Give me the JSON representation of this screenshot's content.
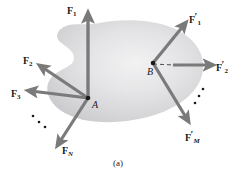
{
  "figure": {
    "caption": "(a)",
    "caption_y": 158,
    "background_color": "#ffffff",
    "arrow_color": "#7a7a7a",
    "dash_color": "#4d4d4d",
    "label_color": "#1a1a1a",
    "blob": {
      "fill_light": "#ececed",
      "fill_mid": "#d8d8da",
      "fill_edge": "#c4c4c7",
      "description": "irregular amoeba-shaped rigid body with concave notch on the left side"
    },
    "points": [
      {
        "name": "A",
        "label": "A",
        "x": 88,
        "y": 98,
        "label_x": 92,
        "label_y": 100
      },
      {
        "name": "B",
        "label": "B",
        "x": 153,
        "y": 63,
        "label_x": 147,
        "label_y": 67
      }
    ],
    "force_vectors": [
      {
        "id": "F1",
        "base": "F",
        "subscript": "1",
        "subscript_italic": false,
        "prime": false,
        "origin": "A",
        "x1": 88,
        "y1": 98,
        "x2": 88,
        "y2": 14,
        "label_x": 67,
        "label_y": 6,
        "width": 3.4
      },
      {
        "id": "F2",
        "base": "F",
        "subscript": "2",
        "subscript_italic": false,
        "prime": false,
        "origin": "A",
        "x1": 88,
        "y1": 98,
        "x2": 40,
        "y2": 66,
        "label_x": 23,
        "label_y": 56,
        "width": 3.2
      },
      {
        "id": "F3",
        "base": "F",
        "subscript": "3",
        "subscript_italic": false,
        "prime": false,
        "origin": "A",
        "x1": 88,
        "y1": 98,
        "x2": 29,
        "y2": 91,
        "label_x": 11,
        "label_y": 89,
        "width": 3.2
      },
      {
        "id": "FN",
        "base": "F",
        "subscript": "N",
        "subscript_italic": true,
        "prime": false,
        "origin": "A",
        "x1": 88,
        "y1": 98,
        "x2": 58,
        "y2": 146,
        "label_x": 62,
        "label_y": 146,
        "width": 3.2
      },
      {
        "id": "F1p",
        "base": "F",
        "subscript": "1",
        "subscript_italic": false,
        "prime": true,
        "origin": "B",
        "x1": 153,
        "y1": 63,
        "x2": 186,
        "y2": 23,
        "label_x": 189,
        "label_y": 12,
        "width": 3.2
      },
      {
        "id": "F2p",
        "base": "F",
        "subscript": "2",
        "subscript_italic": false,
        "prime": true,
        "origin": "B",
        "x1": 172,
        "y1": 65,
        "x2": 213,
        "y2": 65,
        "label_x": 216,
        "label_y": 60,
        "width": 3.2
      },
      {
        "id": "FMp",
        "base": "F",
        "subscript": "M",
        "subscript_italic": true,
        "prime": true,
        "origin": "B",
        "x1": 153,
        "y1": 63,
        "x2": 189,
        "y2": 122,
        "label_x": 185,
        "label_y": 130,
        "width": 3.2
      }
    ],
    "dashed_lines": [
      {
        "name": "dashed-line-through-a",
        "x1": 88,
        "y1": 98,
        "x2": 88,
        "y2": 30
      },
      {
        "name": "dashed-line-b-to-f2p",
        "x1": 153,
        "y1": 64,
        "x2": 174,
        "y2": 65
      },
      {
        "name": "dashed-line-b-to-fmp",
        "x1": 153,
        "y1": 63,
        "x2": 172,
        "y2": 94
      }
    ],
    "ellipsis_groups": [
      {
        "name": "ellipsis-left",
        "dots": [
          {
            "x": 33,
            "y": 116
          },
          {
            "x": 39,
            "y": 122
          },
          {
            "x": 45,
            "y": 127
          }
        ]
      },
      {
        "name": "ellipsis-right",
        "dots": [
          {
            "x": 203,
            "y": 89
          },
          {
            "x": 199,
            "y": 96
          },
          {
            "x": 195,
            "y": 103
          }
        ]
      }
    ]
  }
}
